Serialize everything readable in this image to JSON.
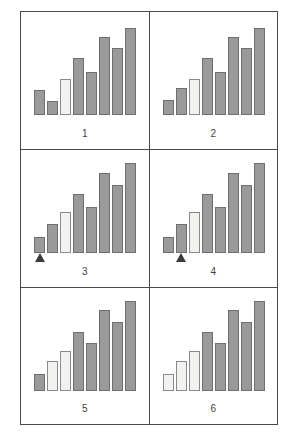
{
  "figure": {
    "title": "",
    "panel_count": 6,
    "bars_per_panel": 8,
    "layout": "2 columns x 3 rows",
    "colors": {
      "bar_fill_dark": "#9a9a9a",
      "bar_fill_light": "#f2f2f0",
      "bar_stroke": "#6f6f6f",
      "panel_border": "#4a4a4a",
      "marker": "#3a3a3a",
      "background": "#ffffff",
      "label_text": "#444444"
    }
  },
  "chart_data": {
    "type": "bar",
    "title": "",
    "xlabel": "",
    "ylabel": "",
    "ylim": [
      0,
      100
    ],
    "grid": false,
    "legend": "none",
    "categories": [
      "1",
      "2",
      "3",
      "4",
      "5",
      "6",
      "7",
      "8"
    ],
    "panels": [
      {
        "label": "1",
        "values": [
          26,
          15,
          38,
          60,
          45,
          82,
          70,
          92
        ],
        "light_bars": [
          3
        ],
        "marker_bar": null
      },
      {
        "label": "2",
        "values": [
          16,
          28,
          38,
          60,
          45,
          82,
          70,
          92
        ],
        "light_bars": [
          3
        ],
        "marker_bar": null
      },
      {
        "label": "3",
        "values": [
          17,
          30,
          43,
          62,
          48,
          84,
          72,
          95
        ],
        "light_bars": [
          3
        ],
        "marker_bar": 1
      },
      {
        "label": "4",
        "values": [
          17,
          30,
          43,
          62,
          48,
          84,
          72,
          95
        ],
        "light_bars": [
          3
        ],
        "marker_bar": 2
      },
      {
        "label": "5",
        "values": [
          18,
          32,
          42,
          62,
          50,
          85,
          73,
          95
        ],
        "light_bars": [
          2,
          3
        ],
        "marker_bar": null
      },
      {
        "label": "6",
        "values": [
          18,
          32,
          42,
          62,
          50,
          85,
          73,
          95
        ],
        "light_bars": [
          1,
          2,
          3
        ],
        "marker_bar": null
      }
    ]
  }
}
